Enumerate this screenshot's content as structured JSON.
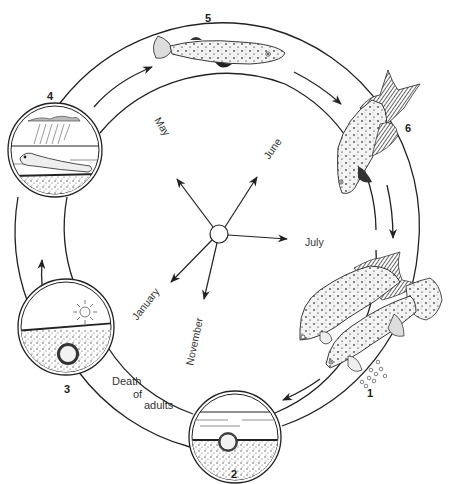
{
  "diagram": {
    "colors": {
      "ink": "#222222",
      "background": "#ffffff",
      "water": "#ffffff",
      "mud": "#6a6a6a"
    },
    "stages": [
      {
        "number": "1",
        "label": "Adults spawning, eggs laid"
      },
      {
        "number": "2",
        "label": "Egg buried in mud under water"
      },
      {
        "number": "3",
        "label": "Egg in dried mud (dry season)"
      },
      {
        "number": "4",
        "label": "Rain; larva hatches"
      },
      {
        "number": "5",
        "label": "Juvenile fish"
      },
      {
        "number": "6",
        "label": "Adult fish"
      }
    ],
    "annotation": {
      "line1": "Death",
      "line2": "of",
      "line3": "adults"
    },
    "months": {
      "may": "May",
      "june": "June",
      "july": "July",
      "january": "January",
      "november": "November"
    }
  }
}
